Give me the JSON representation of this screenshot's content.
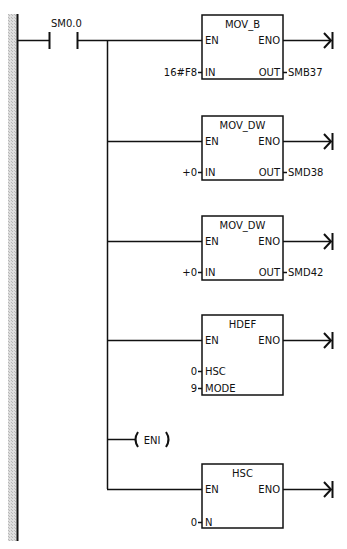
{
  "diagram": {
    "type": "ladder-logic",
    "colors": {
      "line": "#111111",
      "rail_hatch": "#c8c8c8",
      "background": "#ffffff"
    },
    "contact": {
      "label": "SM0.0"
    },
    "blocks": [
      {
        "name": "MOV_B",
        "en": "EN",
        "eno": "ENO",
        "inputs": [
          {
            "pin": "IN",
            "value": "16#F8"
          }
        ],
        "outputs": [
          {
            "pin": "OUT",
            "value": "SMB37"
          }
        ]
      },
      {
        "name": "MOV_DW",
        "en": "EN",
        "eno": "ENO",
        "inputs": [
          {
            "pin": "IN",
            "value": "+0"
          }
        ],
        "outputs": [
          {
            "pin": "OUT",
            "value": "SMD38"
          }
        ]
      },
      {
        "name": "MOV_DW",
        "en": "EN",
        "eno": "ENO",
        "inputs": [
          {
            "pin": "IN",
            "value": "+0"
          }
        ],
        "outputs": [
          {
            "pin": "OUT",
            "value": "SMD42"
          }
        ]
      },
      {
        "name": "HDEF",
        "en": "EN",
        "eno": "ENO",
        "inputs": [
          {
            "pin": "HSC",
            "value": "0"
          },
          {
            "pin": "MODE",
            "value": "9"
          }
        ],
        "outputs": []
      },
      {
        "name": "HSC",
        "en": "EN",
        "eno": "ENO",
        "inputs": [
          {
            "pin": "N",
            "value": "0"
          }
        ],
        "outputs": []
      }
    ],
    "coil": {
      "label": "ENI"
    }
  }
}
